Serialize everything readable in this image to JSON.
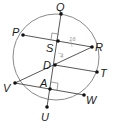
{
  "diagram": {
    "type": "circle-chords",
    "circle": {
      "cx": 56,
      "cy": 57,
      "r": 43
    },
    "points": [
      {
        "id": "Q",
        "label": "Q",
        "x": 61,
        "y": 14,
        "lx": 56,
        "ly": 11
      },
      {
        "id": "P",
        "label": "P",
        "x": 23,
        "y": 35,
        "lx": 12,
        "ly": 36
      },
      {
        "id": "R",
        "label": "R",
        "x": 92,
        "y": 47,
        "lx": 95,
        "ly": 51
      },
      {
        "id": "S",
        "label": "S",
        "x": 58,
        "y": 41,
        "lx": 46,
        "ly": 52
      },
      {
        "id": "D",
        "label": "D",
        "x": 55,
        "y": 65,
        "lx": 43,
        "ly": 69
      },
      {
        "id": "T",
        "label": "T",
        "x": 97,
        "y": 72,
        "lx": 100,
        "ly": 77
      },
      {
        "id": "V",
        "label": "V",
        "x": 15,
        "y": 83,
        "lx": 3,
        "ly": 92
      },
      {
        "id": "A",
        "label": "A",
        "x": 50,
        "y": 89,
        "lx": 40,
        "ly": 87
      },
      {
        "id": "W",
        "label": "W",
        "x": 84,
        "y": 95,
        "lx": 86,
        "ly": 104
      },
      {
        "id": "U",
        "label": "U",
        "x": 47,
        "y": 107,
        "lx": 41,
        "ly": 121
      }
    ],
    "segments": [
      [
        "Q",
        "U"
      ],
      [
        "P",
        "R"
      ],
      [
        "V",
        "R"
      ],
      [
        "D",
        "T"
      ],
      [
        "V",
        "W"
      ]
    ],
    "right_angles": [
      {
        "at": "S",
        "description": "QU perpendicular to PR"
      },
      {
        "at": "A",
        "description": "QU perpendicular to VW"
      }
    ],
    "annotations": [
      {
        "text": "16",
        "x": 69,
        "y": 39,
        "near": "SR"
      },
      {
        "text": "4",
        "x": 60,
        "y": 56,
        "near": "SD"
      }
    ],
    "colors": {
      "circle": "#8a8a8a",
      "lines": "#444444",
      "points": "#111111",
      "annotation": "#9a9a9a"
    }
  }
}
